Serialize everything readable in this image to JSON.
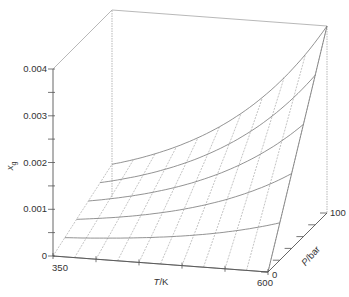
{
  "chart_data": {
    "type": "surface3d",
    "title": "",
    "zlabel": "x_g",
    "xlabel": "T/K",
    "ylabel": "P/bar",
    "x_axis": {
      "label_italic": "T",
      "label_rest": "/K",
      "range": [
        350,
        600
      ],
      "tick_labels": [
        "350",
        "600"
      ],
      "ticks": [
        350,
        400,
        450,
        500,
        550,
        600
      ]
    },
    "y_axis": {
      "label_italic": "P",
      "label_rest": "/bar",
      "range": [
        0,
        100
      ],
      "tick_labels": [
        "0",
        "100"
      ],
      "ticks": [
        0,
        20,
        40,
        60,
        80,
        100
      ]
    },
    "z_axis": {
      "label_italic": "x",
      "label_sub": "g",
      "range": [
        0,
        0.004
      ],
      "tick_labels": [
        "0",
        "0.001",
        "0.002",
        "0.003",
        "0.004"
      ],
      "ticks": [
        0,
        0.0005,
        0.001,
        0.0015,
        0.002,
        0.0025,
        0.003,
        0.0035,
        0.004
      ]
    },
    "grid": {
      "T_lines": [
        350,
        375,
        400,
        425,
        450,
        475,
        500,
        525,
        550,
        575,
        600
      ],
      "P_lines": [
        0,
        20,
        40,
        60,
        80,
        100
      ]
    },
    "surface_model": "x_g = (P/100) * 0.0007 * exp(1.743 * (T-350)/250)",
    "sample_points": [
      {
        "T": 350,
        "P": 100,
        "x_g": 0.0007
      },
      {
        "T": 475,
        "P": 100,
        "x_g": 0.00167
      },
      {
        "T": 600,
        "P": 100,
        "x_g": 0.004
      },
      {
        "T": 600,
        "P": 60,
        "x_g": 0.0024
      },
      {
        "T": 600,
        "P": 20,
        "x_g": 0.0008
      },
      {
        "T": 350,
        "P": 0,
        "x_g": 0
      },
      {
        "T": 600,
        "P": 0,
        "x_g": 0
      }
    ],
    "legend": null
  },
  "colors": {
    "line": "#777777",
    "axis": "#555555",
    "grid": "#9a9a9a",
    "text": "#333333"
  }
}
